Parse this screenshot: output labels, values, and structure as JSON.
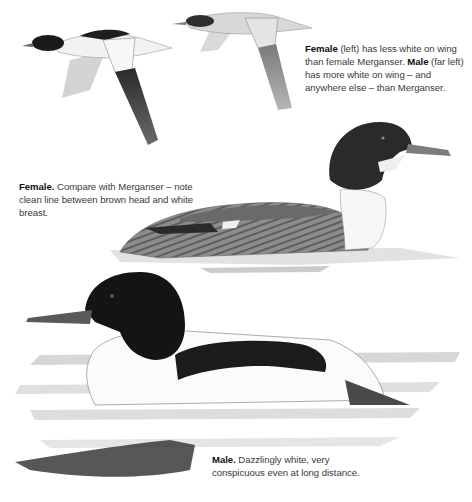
{
  "captions": {
    "flight": {
      "lead1": "Female",
      "text1": " (left) has less white on wing than female Merganser. ",
      "lead2": "Male",
      "text2": " (far left) has more white on wing – and anywhere else – than Merganser."
    },
    "female": {
      "lead": "Female.",
      "text": " Compare with Merganser – note clean line between brown head and white breast."
    },
    "male": {
      "lead": "Male.",
      "text": " Dazzlingly white, very conspicuous even at long distance."
    }
  },
  "illustrations": [
    {
      "name": "male-in-flight",
      "label": "Male goosander in flight"
    },
    {
      "name": "female-in-flight",
      "label": "Female goosander in flight"
    },
    {
      "name": "female-swimming",
      "label": "Female goosander swimming"
    },
    {
      "name": "male-swimming",
      "label": "Male goosander swimming"
    }
  ],
  "colors": {
    "background": "#ffffff",
    "text": "#3a3a3a",
    "bold": "#111111",
    "dark_plumage": "#1c1c1c",
    "female_head": "#2e2e2e",
    "grey_body": "#8a8a8a",
    "water": "#b8b8b8"
  }
}
